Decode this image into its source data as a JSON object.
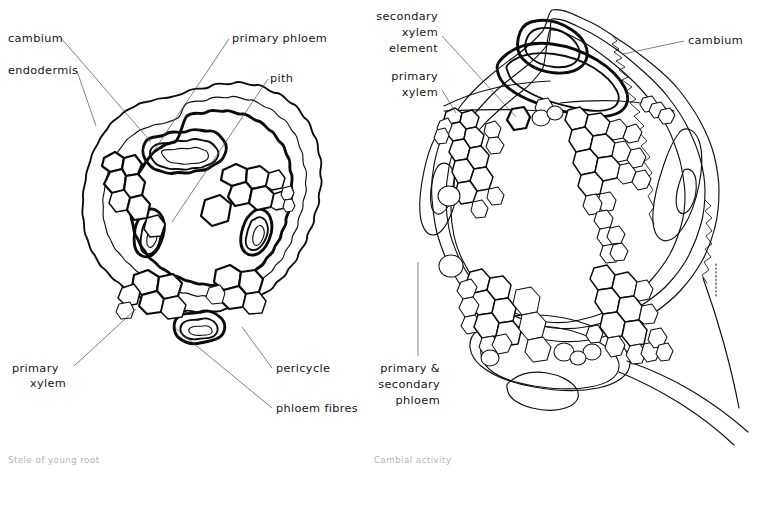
{
  "figure": {
    "background_color": "#ffffff",
    "ink_color": "#0b0b0b",
    "label_color": "#141414",
    "caption_color": "#b3b3b3",
    "leader_color": "#4a4a4a"
  },
  "panels": [
    {
      "id": "left",
      "caption": "Stele of young root",
      "caption_x": 8,
      "caption_y": 463,
      "labels": [
        {
          "key": "cambium",
          "text": "cambium",
          "x": 8,
          "y": 42,
          "anchor": "start",
          "leader": "M 61,38 L 151,142"
        },
        {
          "key": "endodermis",
          "text": "endodermis",
          "x": 8,
          "y": 74,
          "anchor": "start",
          "leader": "M 77,71 L 96,126"
        },
        {
          "key": "primary_phloem",
          "text": "primary phloem",
          "x": 232,
          "y": 42,
          "anchor": "start",
          "leader": "M 229,39 L 151,155"
        },
        {
          "key": "pith",
          "text": "pith",
          "x": 270,
          "y": 82,
          "anchor": "start",
          "leader": "M 268,79 L 172,222"
        },
        {
          "key": "primary_xylem",
          "text": "primary xylem",
          "x": 12,
          "y": 372,
          "anchor": "start",
          "lines": [
            "primary",
            "xylem"
          ],
          "leader": "M 74,366 L 136,309"
        },
        {
          "key": "pericycle",
          "text": "pericycle",
          "x": 276,
          "y": 372,
          "anchor": "start",
          "leader": "M 272,368 L 242,327"
        },
        {
          "key": "phloem_fibres",
          "text": "phloem fibres",
          "x": 276,
          "y": 412,
          "anchor": "start",
          "leader": "M 272,408 L 175,328"
        }
      ]
    },
    {
      "id": "right",
      "caption": "Cambial activity",
      "caption_x": 374,
      "caption_y": 463,
      "labels": [
        {
          "key": "secondary_xylem_element",
          "text": "secondary xylem element",
          "x": 438,
          "y": 20,
          "anchor": "end",
          "lines": [
            "secondary",
            "xylem",
            "element"
          ],
          "leader": "M 442,36 L 516,117"
        },
        {
          "key": "primary_xylem_right",
          "text": "primary xylem",
          "x": 438,
          "y": 82,
          "anchor": "end",
          "lines": [
            "primary",
            "xylem"
          ],
          "leader": "M 442,90 L 454,112"
        },
        {
          "key": "cambium_right",
          "text": "cambium",
          "x": 688,
          "y": 44,
          "anchor": "start",
          "leader": "M 684,41 L 623,54"
        },
        {
          "key": "primary_secondary_phloem",
          "text": "primary & secondary phloem",
          "x": 440,
          "y": 372,
          "anchor": "end",
          "lines": [
            "primary &",
            "secondary",
            "phloem"
          ],
          "leader": "M 418,262 L 418,356"
        }
      ]
    }
  ]
}
